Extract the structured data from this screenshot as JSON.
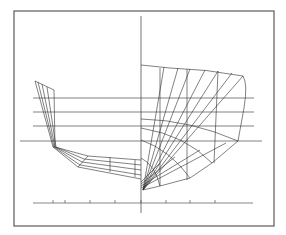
{
  "figure": {
    "colors": {
      "line": "#2e2e2e",
      "frame": "#5a5a5a",
      "background": "#ffffff"
    },
    "frame": {
      "x": 14,
      "y": 11,
      "width": 260,
      "height": 215
    },
    "centerline": {
      "x": 141,
      "y1": 16,
      "y2": 213
    },
    "waterlines": [
      {
        "y": 98,
        "x1": 33,
        "x2": 254
      },
      {
        "y": 112,
        "x1": 33,
        "x2": 254
      },
      {
        "y": 126,
        "x1": 33,
        "x2": 254
      },
      {
        "y": 141,
        "x1": 20,
        "x2": 262
      }
    ],
    "baseline_scale": {
      "y": 203,
      "x1": 33,
      "x2": 253,
      "ticks": [
        53,
        65,
        90,
        115,
        141,
        166,
        190,
        215
      ]
    },
    "aft_half_sections": [
      "M35,81 L53,147 L78,167 L141,179",
      "M38,82 L54,147 L80,165 L141,175",
      "M42,84 L55,147 L82,162 L141,170",
      "M47,87 L56,147 L84,159 L141,165",
      "M54,90 L55,147 L88,156 L141,160"
    ],
    "aft_half_verticals": [
      "M35,81 L54,90",
      "M53,147 L55,147",
      "M78,167 L88,156",
      "M110,172 L110,157",
      "M135,177 L135,160"
    ],
    "fore_half_sections": [
      "M141,65 L170,68 Q206,69 243,76 Q248,84 244,108 L238,141 L212,163 L190,178 L160,186 L143,190",
      "M143,190 L164,67",
      "M143,190 L178,68",
      "M143,190 L190,69",
      "M143,190 L205,70",
      "M143,190 L218,71",
      "M143,190 L232,73",
      "M143,190 L243,76",
      "M160,68 L160,186",
      "M187,69 L187,180",
      "M218,71 L214,163"
    ],
    "fore_half_waterline_curves": [
      "M141,119 Q190,120 238,141",
      "M141,128 Q185,135 212,163",
      "M141,140 Q170,150 190,178",
      "M141,158 Q155,165 160,186"
    ],
    "bow_rays": [
      "M141,182 L160,163",
      "M141,184 L175,157",
      "M141,186 L200,150",
      "M141,188 L226,143"
    ]
  }
}
